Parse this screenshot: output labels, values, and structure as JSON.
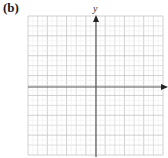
{
  "panel": {
    "label": "(b)"
  },
  "axes": {
    "y_label": "y",
    "x_label": "",
    "axis_color": "#555555",
    "grid_color": "#d8d8d8",
    "grid_major_color": "#c4c4c4"
  },
  "grid": {
    "columns": 14,
    "rows": 14,
    "left": 28,
    "top": 16,
    "right": 163,
    "bottom": 155,
    "origin_x": 96,
    "origin_y": 87
  }
}
